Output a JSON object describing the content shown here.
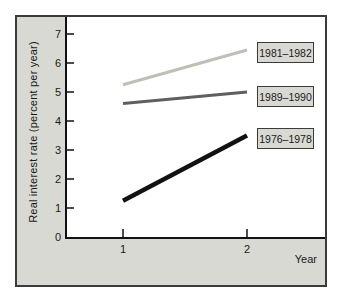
{
  "chart_data": {
    "type": "line",
    "title": "",
    "xlabel": "Year",
    "ylabel": "Real interest rate (percent per year)",
    "x": [
      1,
      2
    ],
    "x_ticks": [
      "1",
      "2"
    ],
    "y_ticks": [
      "0",
      "1",
      "2",
      "3",
      "4",
      "5",
      "6",
      "7"
    ],
    "ylim": [
      0,
      7
    ],
    "grid": false,
    "legend_position": "right-inline-boxes",
    "series": [
      {
        "name": "1981–1982",
        "values": [
          5.25,
          6.45
        ],
        "color": "#bfbfb7"
      },
      {
        "name": "1989–1990",
        "values": [
          4.6,
          5.0
        ],
        "color": "#5f5f5f"
      },
      {
        "name": "1976–1978",
        "values": [
          1.25,
          3.5
        ],
        "color": "#121212"
      }
    ]
  }
}
